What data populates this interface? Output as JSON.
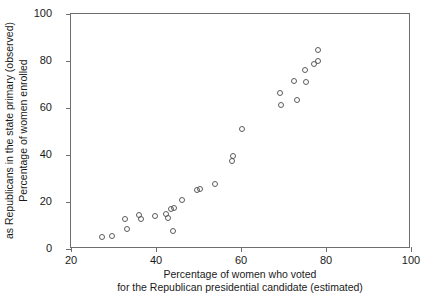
{
  "chart_data": {
    "type": "scatter",
    "title": "",
    "xlabel": "Percentage of women who voted for the Republican presidential candidate (estimated)",
    "xlabel_lines": [
      "Percentage of women who voted",
      "for the Republican presidential candidate (estimated)"
    ],
    "ylabel": "Percentage of women enrolled as Republicans in the state primary (observed)",
    "ylabel_lines": [
      "Percentage of women enrolled",
      "as Republicans in the state primary (observed)"
    ],
    "xlim": [
      20,
      100
    ],
    "ylim": [
      0,
      100
    ],
    "xticks": [
      20,
      40,
      60,
      80,
      100
    ],
    "yticks": [
      0,
      20,
      40,
      60,
      80,
      100
    ],
    "grid": false,
    "legend": null,
    "marker": "open-circle",
    "marker_color": "#5c5c5c",
    "points": [
      {
        "x": 27.3,
        "y": 5.1
      },
      {
        "x": 29.6,
        "y": 5.5
      },
      {
        "x": 32.8,
        "y": 12.9
      },
      {
        "x": 33.1,
        "y": 8.6
      },
      {
        "x": 36.1,
        "y": 14.3
      },
      {
        "x": 36.5,
        "y": 12.6
      },
      {
        "x": 39.8,
        "y": 14.0
      },
      {
        "x": 42.4,
        "y": 14.8
      },
      {
        "x": 42.8,
        "y": 13.2
      },
      {
        "x": 43.6,
        "y": 17.2
      },
      {
        "x": 44.2,
        "y": 17.6
      },
      {
        "x": 44.1,
        "y": 7.7
      },
      {
        "x": 46.2,
        "y": 20.9
      },
      {
        "x": 49.6,
        "y": 25.1
      },
      {
        "x": 50.4,
        "y": 25.5
      },
      {
        "x": 53.9,
        "y": 27.7
      },
      {
        "x": 57.9,
        "y": 37.4
      },
      {
        "x": 58.0,
        "y": 39.6
      },
      {
        "x": 60.3,
        "y": 51.1
      },
      {
        "x": 69.2,
        "y": 66.4
      },
      {
        "x": 69.3,
        "y": 61.3
      },
      {
        "x": 72.4,
        "y": 71.5
      },
      {
        "x": 73.2,
        "y": 63.4
      },
      {
        "x": 75.4,
        "y": 71.1
      },
      {
        "x": 75.1,
        "y": 76.2
      },
      {
        "x": 77.2,
        "y": 78.7
      },
      {
        "x": 78.2,
        "y": 80.0
      },
      {
        "x": 78.2,
        "y": 84.7
      }
    ]
  }
}
